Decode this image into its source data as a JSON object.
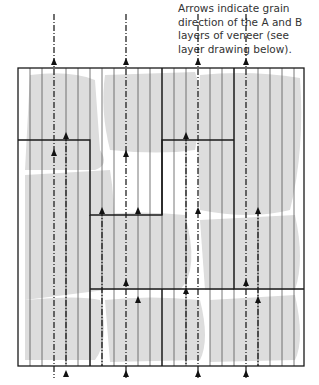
{
  "caption": {
    "line1": "Arrows indicate grain",
    "line2": "direction of the A and B",
    "line3": "layers of veneer (see",
    "line4": "layer drawing below)."
  },
  "colors": {
    "outline": "#1a1a1a",
    "grain_line": "#555555",
    "shade": "#dddddd",
    "arrow": "#111111"
  },
  "diagram": {
    "frame": {
      "x": 18,
      "y": 68,
      "w": 286,
      "h": 298
    },
    "grain_spacing": 12,
    "arrows_up_x": [
      54,
      126,
      198,
      246
    ]
  }
}
